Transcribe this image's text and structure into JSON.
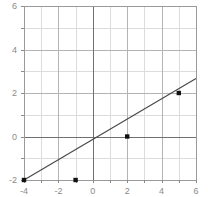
{
  "chart_data": {
    "type": "line",
    "title": "",
    "subtitle": "",
    "xlabel": "",
    "ylabel": "",
    "xlim": [
      -4,
      6
    ],
    "ylim": [
      -2,
      6
    ],
    "grid": true,
    "legend": null,
    "x_ticks": [
      -4,
      -2,
      0,
      2,
      4,
      6
    ],
    "x_tick_labels": [
      "-4",
      "-2",
      "0",
      "2",
      "4",
      "6"
    ],
    "y_ticks": [
      -2,
      0,
      2,
      4,
      6
    ],
    "y_tick_labels": [
      "-2",
      "0",
      "2",
      "4",
      "6"
    ],
    "x_minor_step": 1,
    "y_minor_step": 1,
    "series": [
      {
        "name": "line",
        "equation": "y = (2/3)x - 4/3",
        "slope": 0.6667,
        "intercept": -1.3333,
        "line_endpoints": [
          {
            "x": -4,
            "y": -2
          },
          {
            "x": 6,
            "y": 2.6667
          }
        ],
        "marker_points": [
          {
            "x": -4,
            "y": -2
          },
          {
            "x": -1,
            "y": -2
          },
          {
            "x": 2,
            "y": 0
          },
          {
            "x": 5,
            "y": 2
          }
        ],
        "line_color": "#4a4a4a",
        "marker_color": "#111111",
        "marker_shape": "square"
      }
    ],
    "colors": {
      "background": "#ffffff",
      "grid_minor": "#d8d8d8",
      "grid_major": "#b0b0b0",
      "axis": "#808080",
      "axis_zero": "#6e6e6e",
      "tick_text": "#8a8a8a",
      "plot_border": "#9a9a9a"
    }
  },
  "figure": {
    "width": 208,
    "height": 197,
    "plot_left": 24,
    "plot_right": 196,
    "plot_top": 6,
    "plot_bottom": 180
  }
}
